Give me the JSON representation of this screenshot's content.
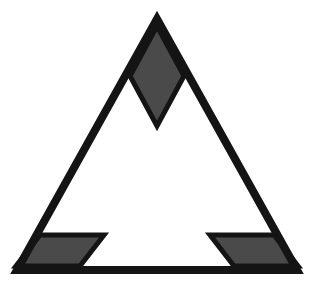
{
  "figure": {
    "title": "Isosceles triangle with three marked interior angles",
    "background_color": "#ffffff",
    "canvas": {
      "width": 312,
      "height": 291
    },
    "stroke": {
      "color": "#141414",
      "width": 8,
      "linejoin": "miter"
    },
    "marker_fill": "#4a4a4a",
    "marker_stroke": "#141414",
    "marker_stroke_width": 5,
    "triangle": {
      "name": "triangle-outline",
      "points": "157,19 297,270 17,270",
      "vertices": {
        "apex": {
          "label": "A",
          "x": 157,
          "y": 19
        },
        "bottom_right": {
          "label": "B",
          "x": 297,
          "y": 270
        },
        "bottom_left": {
          "label": "C",
          "x": 17,
          "y": 270
        }
      }
    },
    "angle_markers": [
      {
        "name": "apex-angle-marker",
        "shape": "rhombus",
        "at_vertex": "apex",
        "points": "157,26 184,76 157,126 130,76"
      },
      {
        "name": "bottom-left-angle-marker",
        "shape": "parallelogram",
        "at_vertex": "bottom_left",
        "points": "40,235 104,235 80,266 16,266"
      },
      {
        "name": "bottom-right-angle-marker",
        "shape": "parallelogram",
        "at_vertex": "bottom_right",
        "points": "210,235 274,235 298,266 234,266"
      }
    ]
  }
}
